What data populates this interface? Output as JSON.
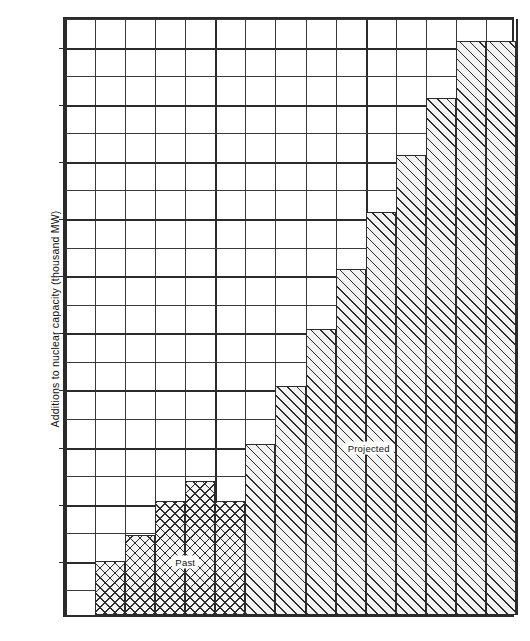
{
  "chart_data": {
    "type": "bar",
    "title": "",
    "subtitle": "",
    "xlabel": "",
    "ylabel": "Additions to nuclear capacity (thousand MW)",
    "xlim": [
      1975,
      1990
    ],
    "ylim": [
      0,
      10500
    ],
    "grid": true,
    "legend_position": "inline-annotations",
    "y_ticks": [
      {
        "value": 10000,
        "label": "10,000"
      },
      {
        "value": 9000,
        "label": "9,000"
      },
      {
        "value": 8000,
        "label": "8,000"
      },
      {
        "value": 7000,
        "label": "7,000"
      },
      {
        "value": 6000,
        "label": "6,000"
      },
      {
        "value": 5000,
        "label": "5,000"
      },
      {
        "value": 4000,
        "label": "4,000"
      },
      {
        "value": 3000,
        "label": "3,000"
      },
      {
        "value": 2000,
        "label": "2,000"
      },
      {
        "value": 1000,
        "label": "1,000"
      }
    ],
    "y_minor_gridlines": [
      500,
      1500,
      2500,
      3500,
      4500,
      5500,
      6500,
      7500,
      8500,
      9500,
      10500
    ],
    "x_ticks": [
      {
        "value": 1975,
        "label": "1975"
      },
      {
        "value": 1980,
        "label": "1980"
      },
      {
        "value": 1985,
        "label": "1985"
      },
      {
        "value": 1990,
        "label": "1990"
      }
    ],
    "x_gridline_years": [
      1975,
      1976,
      1977,
      1978,
      1979,
      1980,
      1981,
      1982,
      1983,
      1984,
      1985,
      1986,
      1987,
      1988,
      1989,
      1990
    ],
    "categories": [
      1975,
      1976,
      1977,
      1978,
      1979,
      1980,
      1981,
      1982,
      1983,
      1984,
      1985,
      1986,
      1987,
      1988,
      1989
    ],
    "series": [
      {
        "name": "Past",
        "pattern": "cross-hatch",
        "values": [
          0,
          950,
          1400,
          2000,
          2350,
          2000,
          null,
          null,
          null,
          null,
          null,
          null,
          null,
          null,
          null
        ]
      },
      {
        "name": "Projected",
        "pattern": "diagonal-hatch",
        "values": [
          null,
          null,
          null,
          null,
          null,
          null,
          3000,
          4000,
          5000,
          6050,
          7050,
          8050,
          9050,
          10050,
          10050
        ]
      }
    ],
    "annotations": [
      {
        "text": "Past",
        "x": 1979.0,
        "y": 1000
      },
      {
        "text": "Projected",
        "x": 1985.1,
        "y": 3000
      }
    ]
  }
}
